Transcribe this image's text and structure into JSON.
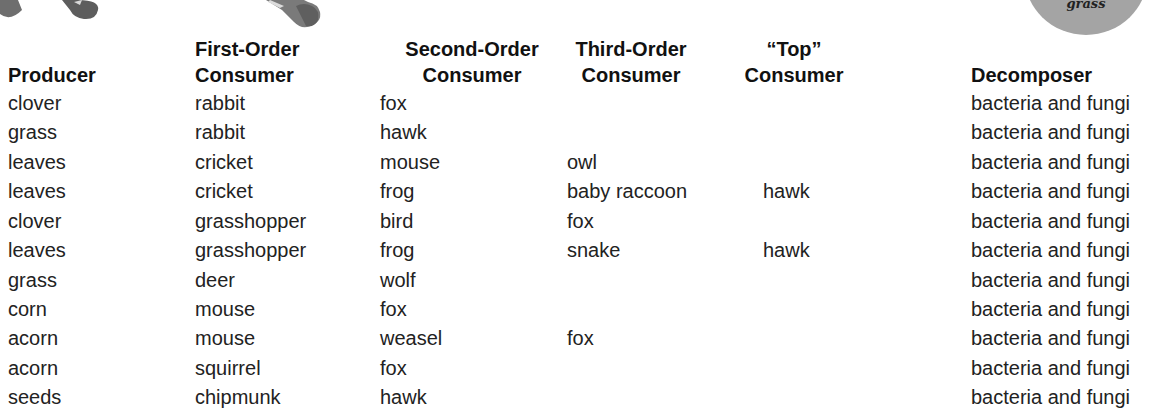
{
  "decorations": {
    "badge_text": "grass"
  },
  "table": {
    "headers": [
      {
        "line1": "",
        "line2": "Producer"
      },
      {
        "line1": "First-Order",
        "line2": "Consumer"
      },
      {
        "line1": "Second-Order",
        "line2": "Consumer"
      },
      {
        "line1": "Third-Order",
        "line2": "Consumer"
      },
      {
        "line1": "“Top”",
        "line2": "Consumer"
      },
      {
        "line1": "",
        "line2": "Decomposer"
      }
    ],
    "rows": [
      [
        "clover",
        "rabbit",
        "fox",
        "",
        "",
        "bacteria and fungi"
      ],
      [
        "grass",
        "rabbit",
        "hawk",
        "",
        "",
        "bacteria and fungi"
      ],
      [
        "leaves",
        "cricket",
        "mouse",
        "owl",
        "",
        "bacteria and fungi"
      ],
      [
        "leaves",
        "cricket",
        "frog",
        "baby raccoon",
        "hawk",
        "bacteria and fungi"
      ],
      [
        "clover",
        "grasshopper",
        "bird",
        "fox",
        "",
        "bacteria and fungi"
      ],
      [
        "leaves",
        "grasshopper",
        "frog",
        "snake",
        "hawk",
        "bacteria and fungi"
      ],
      [
        "grass",
        "deer",
        "wolf",
        "",
        "",
        "bacteria and fungi"
      ],
      [
        "corn",
        "mouse",
        "fox",
        "",
        "",
        "bacteria and fungi"
      ],
      [
        "acorn",
        "mouse",
        "weasel",
        "fox",
        "",
        "bacteria and fungi"
      ],
      [
        "acorn",
        "squirrel",
        "fox",
        "",
        "",
        "bacteria and fungi"
      ],
      [
        "seeds",
        "chipmunk",
        "hawk",
        "",
        "",
        "bacteria and fungi"
      ]
    ]
  }
}
